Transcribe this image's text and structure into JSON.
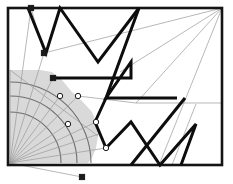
{
  "figure": {
    "canvas": {
      "width": 233,
      "height": 184,
      "background": "#ffffff"
    },
    "colors": {
      "frame": "#141414",
      "thick_path": "#0d0d0d",
      "thin_line": "#9a9a9a",
      "arc": "#6f6f6f",
      "sector_fill": "#d9d9d9",
      "marker_fill_open": "#ffffff",
      "marker_fill_solid": "#1a1a1a",
      "marker_stroke": "#1a1a1a"
    },
    "stroke_widths": {
      "frame": 2.6,
      "thick_path": 3.0,
      "thin_line": 0.7,
      "arc": 1.1,
      "marker": 1.0
    },
    "frame": {
      "label": "bounding-rectangle",
      "x": 8,
      "y": 8,
      "width": 214,
      "height": 157
    },
    "fan_origin": {
      "x": 10,
      "y": 163,
      "label": "ray-fan-apex"
    },
    "sector_region": {
      "label": "shaded-visibility-sector",
      "fill": "#d9d9d9",
      "polygon": "10,163 10,70 40,70 52,72 62,80 72,92 82,101 92,112 97,124 98,136 96,148 92,158 88,163"
    },
    "arcs": [
      {
        "name": "arc-inner",
        "d": "M 10,112 A 51,51 0 0 1 61,163"
      },
      {
        "name": "arc-middle",
        "d": "M 10,96 A 67,67 0 0 1 77,163"
      },
      {
        "name": "arc-outer",
        "d": "M 10,82 A 81,81 0 0 1 91,163"
      }
    ],
    "radial_lines": [
      {
        "name": "ray-1",
        "x1": 10,
        "y1": 163,
        "x2": 10,
        "y2": 70
      },
      {
        "name": "ray-2",
        "x1": 10,
        "y1": 163,
        "x2": 31,
        "y2": 8
      },
      {
        "name": "ray-3",
        "x1": 10,
        "y1": 163,
        "x2": 44,
        "y2": 53
      },
      {
        "name": "ray-4",
        "x1": 10,
        "y1": 163,
        "x2": 53,
        "y2": 78
      },
      {
        "name": "ray-5",
        "x1": 10,
        "y1": 163,
        "x2": 60,
        "y2": 96
      },
      {
        "name": "ray-6",
        "x1": 10,
        "y1": 163,
        "x2": 78,
        "y2": 96
      },
      {
        "name": "ray-7",
        "x1": 10,
        "y1": 163,
        "x2": 68,
        "y2": 124
      },
      {
        "name": "ray-8",
        "x1": 10,
        "y1": 163,
        "x2": 96,
        "y2": 122
      },
      {
        "name": "ray-9",
        "x1": 10,
        "y1": 163,
        "x2": 106,
        "y2": 148
      },
      {
        "name": "ray-10",
        "x1": 10,
        "y1": 163,
        "x2": 99,
        "y2": 134
      },
      {
        "name": "ray-11",
        "x1": 10,
        "y1": 163,
        "x2": 82,
        "y2": 177
      }
    ],
    "thin_lines": [
      {
        "name": "thin-topright-fan-a",
        "x1": 222,
        "y1": 8,
        "x2": 44,
        "y2": 53
      },
      {
        "name": "thin-topright-fan-b",
        "x1": 222,
        "y1": 8,
        "x2": 120,
        "y2": 72
      },
      {
        "name": "thin-topright-fan-c",
        "x1": 222,
        "y1": 8,
        "x2": 136,
        "y2": 103
      },
      {
        "name": "thin-topright-fan-d",
        "x1": 222,
        "y1": 8,
        "x2": 159,
        "y2": 165
      },
      {
        "name": "thin-mid-horizontal",
        "x1": 136,
        "y1": 103,
        "x2": 222,
        "y2": 103
      },
      {
        "name": "thin-diagonal-right",
        "x1": 196,
        "y1": 104,
        "x2": 172,
        "y2": 165
      },
      {
        "name": "thin-left-vertical",
        "x1": 31,
        "y1": 8,
        "x2": 44,
        "y2": 53
      },
      {
        "name": "thin-diagonal-mid",
        "x1": 78,
        "y1": 96,
        "x2": 136,
        "y2": 103
      },
      {
        "name": "thin-shade-edge",
        "x1": 10,
        "y1": 70,
        "x2": 98,
        "y2": 136
      }
    ],
    "thick_paths": [
      {
        "name": "thick-path-upper-left",
        "points": "28,8 46,53 60,8 98,62 139,8"
      },
      {
        "name": "thick-path-step",
        "points": "53,78 131,78 131,62 106,98 177,98"
      },
      {
        "name": "thick-path-lower-right",
        "points": "106,148 131,122 160,165 196,124 181,165"
      },
      {
        "name": "thick-path-descender-left",
        "points": "139,8 106,98 95,122"
      },
      {
        "name": "thick-path-cross-lower",
        "points": "131,165 185,98"
      },
      {
        "name": "thick-path-cross-tail",
        "points": "95,122 106,148"
      }
    ],
    "markers": [
      {
        "name": "vertex-marker-solid-1",
        "x": 44,
        "y": 53,
        "shape": "square",
        "style": "solid"
      },
      {
        "name": "vertex-marker-solid-2",
        "x": 53,
        "y": 78,
        "shape": "square",
        "style": "solid"
      },
      {
        "name": "vertex-marker-open-1",
        "x": 60,
        "y": 96,
        "shape": "circle",
        "style": "open"
      },
      {
        "name": "vertex-marker-open-2",
        "x": 78,
        "y": 96,
        "shape": "circle",
        "style": "open"
      },
      {
        "name": "vertex-marker-open-3",
        "x": 68,
        "y": 124,
        "shape": "circle",
        "style": "open"
      },
      {
        "name": "vertex-marker-open-4",
        "x": 96,
        "y": 122,
        "shape": "circle",
        "style": "open"
      },
      {
        "name": "vertex-marker-open-5",
        "x": 106,
        "y": 148,
        "shape": "circle",
        "style": "open"
      },
      {
        "name": "vertex-marker-solid-3",
        "x": 31,
        "y": 8,
        "shape": "square",
        "style": "solid"
      },
      {
        "name": "terminal-marker-below-frame",
        "x": 82,
        "y": 177,
        "shape": "square",
        "style": "solid"
      }
    ]
  }
}
